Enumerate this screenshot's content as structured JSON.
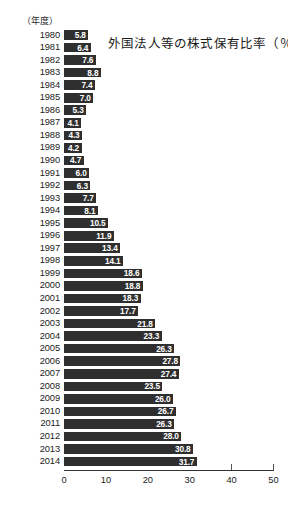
{
  "unit_caption": "（年度）",
  "chart_data": {
    "type": "bar",
    "orientation": "horizontal",
    "title": "外国法人等の株式保有比率（％）",
    "xlabel": "",
    "ylabel": "（年度）",
    "xlim": [
      0,
      50
    ],
    "xticks": [
      "0",
      "10",
      "20",
      "30",
      "40",
      "50"
    ],
    "xtick_values": [
      0,
      10,
      20,
      30,
      40,
      50
    ],
    "grid": false,
    "legend": null,
    "bar_color": "#2f2f2f",
    "value_label_color": "#ffffff",
    "categories": [
      "1980",
      "1981",
      "1982",
      "1983",
      "1984",
      "1985",
      "1986",
      "1987",
      "1988",
      "1989",
      "1990",
      "1991",
      "1992",
      "1993",
      "1994",
      "1995",
      "1996",
      "1997",
      "1998",
      "1999",
      "2000",
      "2001",
      "2002",
      "2003",
      "2004",
      "2005",
      "2006",
      "2007",
      "2008",
      "2009",
      "2010",
      "2011",
      "2012",
      "2013",
      "2014"
    ],
    "values": [
      5.8,
      6.4,
      7.6,
      8.8,
      7.4,
      7.0,
      5.3,
      4.1,
      4.3,
      4.2,
      4.7,
      6.0,
      6.3,
      7.7,
      8.1,
      10.5,
      11.9,
      13.4,
      14.1,
      18.6,
      18.8,
      18.3,
      17.7,
      21.8,
      23.3,
      26.3,
      27.8,
      27.4,
      23.5,
      26.0,
      26.7,
      26.3,
      28.0,
      30.8,
      31.7
    ],
    "value_labels": [
      "5.8",
      "6.4",
      "7.6",
      "8.8",
      "7.4",
      "7.0",
      "5.3",
      "4.1",
      "4.3",
      "4.2",
      "4.7",
      "6.0",
      "6.3",
      "7.7",
      "8.1",
      "10.5",
      "11.9",
      "13.4",
      "14.1",
      "18.6",
      "18.8",
      "18.3",
      "17.7",
      "21.8",
      "23.3",
      "26.3",
      "27.8",
      "27.4",
      "23.5",
      "26.0",
      "26.7",
      "26.3",
      "28.0",
      "30.8",
      "31.7"
    ]
  }
}
